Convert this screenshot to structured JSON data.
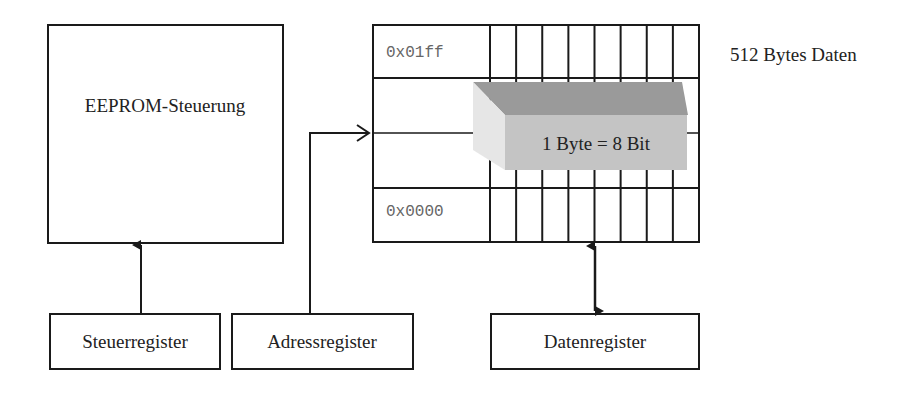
{
  "diagram": {
    "controller": {
      "label": "EEPROM-Steuerung"
    },
    "memory": {
      "label": "512 Bytes Daten",
      "address_high": "0x01ff",
      "address_low": "0x0000",
      "bits_per_byte": 8,
      "byte_callout": "1 Byte = 8 Bit"
    },
    "registers": [
      {
        "id": "control",
        "label": "Steuerregister"
      },
      {
        "id": "address",
        "label": "Adressregister"
      },
      {
        "id": "data",
        "label": "Datenregister"
      }
    ],
    "connections": [
      {
        "from": "Steuerregister",
        "to": "EEPROM-Steuerung",
        "type": "arrow"
      },
      {
        "from": "Adressregister",
        "to": "Speicher",
        "type": "open-arrow"
      },
      {
        "from": "Datenregister",
        "to": "Speicher",
        "type": "bidirectional"
      }
    ],
    "colors": {
      "line": "#1a1a1a",
      "box_top": "#9a9a9a",
      "box_front": "#c4c4c4",
      "box_side": "#e6e6e6",
      "address_text": "#666666"
    }
  }
}
